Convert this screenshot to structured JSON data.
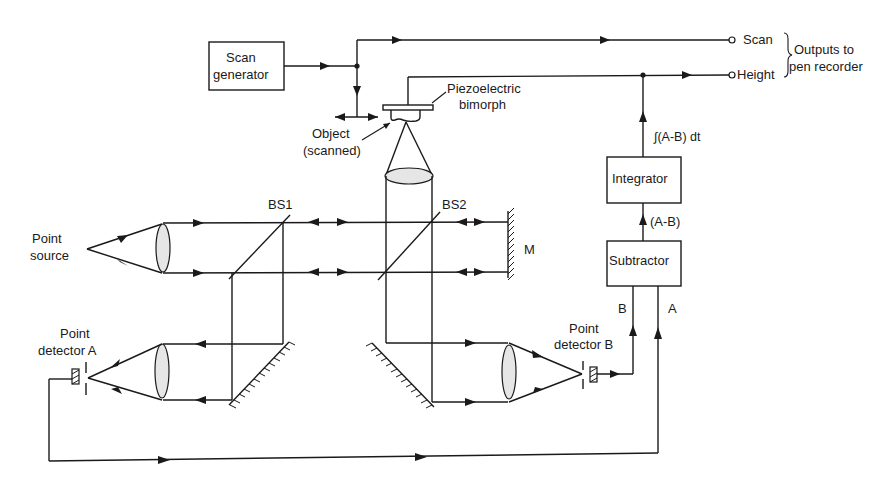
{
  "blocks": {
    "scan_generator": {
      "line1": "Scan",
      "line2": "generator"
    },
    "integrator": {
      "label": "Integrator"
    },
    "subtractor": {
      "label": "Subtractor"
    }
  },
  "labels": {
    "piezo_line1": "Piezoelectric",
    "piezo_line2": "bimorph",
    "object_line1": "Object",
    "object_line2": "(scanned)",
    "point_source_line1": "Point",
    "point_source_line2": "source",
    "bs1": "BS1",
    "bs2": "BS2",
    "mirror": "M",
    "detector_a_line1": "Point",
    "detector_a_line2": "detector A",
    "detector_b_line1": "Point",
    "detector_b_line2": "detector B",
    "signal_b": "B",
    "signal_a": "A",
    "difference": "(A-B)",
    "integral": "∫(A-B) dt"
  },
  "outputs": {
    "scan": "Scan",
    "height": "Height",
    "group_line1": "Outputs to",
    "group_line2": "pen recorder"
  }
}
